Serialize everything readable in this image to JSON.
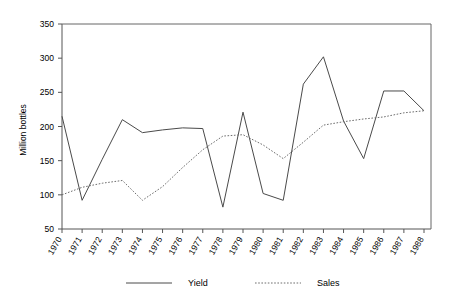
{
  "chart_data": {
    "type": "line",
    "title": "",
    "xlabel": "",
    "ylabel": "Million bottles",
    "ylim": [
      50,
      350
    ],
    "ytick_values": [
      50,
      100,
      150,
      200,
      250,
      300,
      350
    ],
    "ytick_labels": [
      "50",
      "100",
      "150",
      "200",
      "250",
      "300",
      "350"
    ],
    "grid": false,
    "legend_position": "bottom",
    "categories": [
      "1970",
      "1971",
      "1972",
      "1973",
      "1974",
      "1975",
      "1976",
      "1977",
      "1978",
      "1979",
      "1980",
      "1981",
      "1982",
      "1983",
      "1984",
      "1985",
      "1986",
      "1987",
      "1988"
    ],
    "series": [
      {
        "name": "Yield",
        "style": "solid",
        "color": "#4a4a4a",
        "values": [
          215,
          92,
          152,
          210,
          191,
          195,
          198,
          197,
          82,
          221,
          102,
          92,
          262,
          302,
          208,
          153,
          252,
          252,
          223
        ]
      },
      {
        "name": "Sales",
        "style": "dotted",
        "color": "#6e6e6e",
        "values": [
          100,
          111,
          117,
          121,
          92,
          112,
          140,
          166,
          186,
          188,
          173,
          153,
          177,
          202,
          207,
          211,
          214,
          220,
          223
        ]
      }
    ]
  },
  "legend": {
    "items": [
      {
        "label": "Yield",
        "style": "solid"
      },
      {
        "label": "Sales",
        "style": "dotted"
      }
    ]
  }
}
